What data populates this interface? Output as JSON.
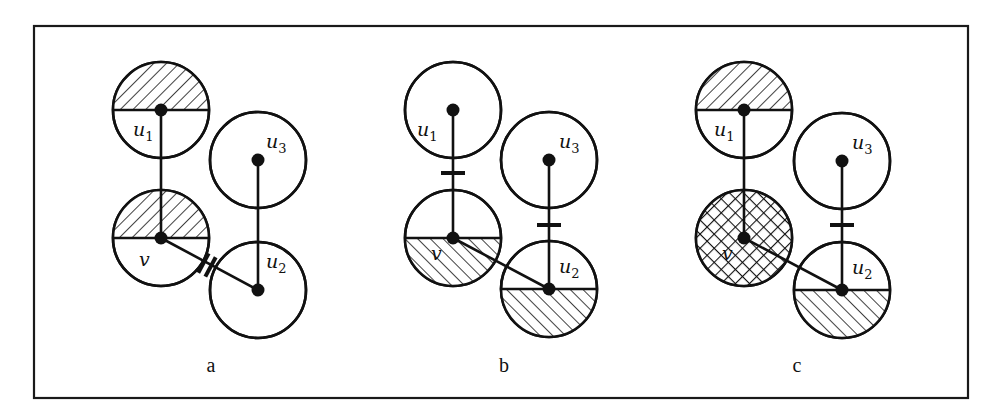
{
  "figure": {
    "frame": {
      "x": 34,
      "y": 26,
      "width": 934,
      "height": 372
    },
    "radius": 48,
    "hatch_colors": {
      "stroke": "#111111",
      "fill": "#ffffff"
    },
    "panels": [
      {
        "id": "a",
        "label": "a",
        "label_pos": [
          211,
          372
        ],
        "nodes": {
          "u1": {
            "label": "u",
            "sub": "1",
            "x": 161,
            "y": 110,
            "shade": "top",
            "pattern": "hatch-back",
            "label_dx": -28,
            "label_dy": 26
          },
          "v": {
            "label": "v",
            "sub": "",
            "x": 161,
            "y": 238,
            "shade": "top",
            "pattern": "hatch-back",
            "label_dx": -22,
            "label_dy": 28
          },
          "u3": {
            "label": "u",
            "sub": "3",
            "x": 258,
            "y": 160,
            "shade": "none",
            "pattern": "",
            "label_dx": 8,
            "label_dy": -12
          },
          "u2": {
            "label": "u",
            "sub": "2",
            "x": 258,
            "y": 290,
            "shade": "none",
            "pattern": "",
            "label_dx": 8,
            "label_dy": -22
          }
        },
        "edges": [
          [
            "u1",
            "v"
          ],
          [
            "v",
            "u2"
          ],
          [
            "u3",
            "u2"
          ]
        ],
        "marks": [
          {
            "type": "double-slash",
            "edge": [
              "v",
              "u2"
            ],
            "x": 207,
            "y": 265
          }
        ]
      },
      {
        "id": "b",
        "label": "b",
        "label_pos": [
          504,
          372
        ],
        "nodes": {
          "u1": {
            "label": "u",
            "sub": "1",
            "x": 453,
            "y": 110,
            "shade": "none",
            "pattern": "",
            "label_dx": -36,
            "label_dy": 26
          },
          "v": {
            "label": "v",
            "sub": "",
            "x": 453,
            "y": 238,
            "shade": "bottom",
            "pattern": "hatch-fwd",
            "label_dx": -22,
            "label_dy": 22
          },
          "u3": {
            "label": "u",
            "sub": "3",
            "x": 549,
            "y": 160,
            "shade": "none",
            "pattern": "",
            "label_dx": 10,
            "label_dy": -12
          },
          "u2": {
            "label": "u",
            "sub": "2",
            "x": 549,
            "y": 289,
            "shade": "bottom",
            "pattern": "hatch-fwd",
            "label_dx": 10,
            "label_dy": -16
          }
        },
        "edges": [
          [
            "u1",
            "v"
          ],
          [
            "v",
            "u2"
          ],
          [
            "u3",
            "u2"
          ]
        ],
        "marks": [
          {
            "type": "bar",
            "edge": [
              "u1",
              "v"
            ],
            "x": 453,
            "y": 173
          },
          {
            "type": "bar",
            "edge": [
              "u3",
              "u2"
            ],
            "x": 549,
            "y": 225
          }
        ]
      },
      {
        "id": "c",
        "label": "c",
        "label_pos": [
          797,
          372
        ],
        "nodes": {
          "u1": {
            "label": "u",
            "sub": "1",
            "x": 744,
            "y": 110,
            "shade": "top",
            "pattern": "hatch-back",
            "label_dx": -30,
            "label_dy": 26
          },
          "v": {
            "label": "v",
            "sub": "",
            "x": 744,
            "y": 238,
            "shade": "full",
            "pattern": "crosshatch",
            "label_dx": -22,
            "label_dy": 22
          },
          "u3": {
            "label": "u",
            "sub": "3",
            "x": 842,
            "y": 161,
            "shade": "none",
            "pattern": "",
            "label_dx": 10,
            "label_dy": -12
          },
          "u2": {
            "label": "u",
            "sub": "2",
            "x": 842,
            "y": 290,
            "shade": "bottom",
            "pattern": "hatch-fwd",
            "label_dx": 10,
            "label_dy": -16
          }
        },
        "edges": [
          [
            "u1",
            "v"
          ],
          [
            "v",
            "u2"
          ],
          [
            "u3",
            "u2"
          ]
        ],
        "marks": [
          {
            "type": "bar",
            "edge": [
              "u3",
              "u2"
            ],
            "x": 842,
            "y": 225
          }
        ]
      }
    ]
  }
}
